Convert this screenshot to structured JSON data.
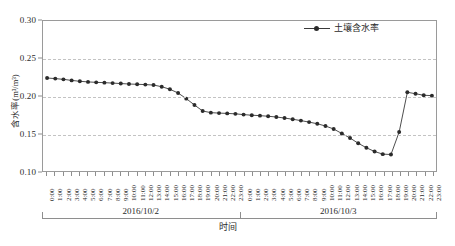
{
  "chart_data": {
    "type": "line",
    "title": "",
    "xlabel": "时间",
    "ylabel": "含水率(m³/m³)",
    "ylim": [
      0.1,
      0.3
    ],
    "y_ticks": [
      "0.30",
      "0.25",
      "0.20",
      "0.15",
      "0.10"
    ],
    "y_tick_values": [
      0.3,
      0.25,
      0.2,
      0.15,
      0.1
    ],
    "gridlines": [
      0.25,
      0.2,
      0.15
    ],
    "grid": true,
    "legend_position": "top-right",
    "marker": "circle",
    "line_color": "#3a3a3a",
    "marker_color": "#2b2b2b",
    "series": [
      {
        "name": "土壤含水率",
        "values": [
          0.224,
          0.2232,
          0.2222,
          0.2208,
          0.2196,
          0.2188,
          0.2182,
          0.2178,
          0.2172,
          0.2166,
          0.216,
          0.2156,
          0.2152,
          0.2146,
          0.2124,
          0.209,
          0.204,
          0.1965,
          0.188,
          0.18,
          0.1778,
          0.1772,
          0.1768,
          0.1762,
          0.1752,
          0.1744,
          0.1738,
          0.173,
          0.172,
          0.1706,
          0.169,
          0.1672,
          0.1652,
          0.163,
          0.16,
          0.156,
          0.15,
          0.144,
          0.137,
          0.131,
          0.126,
          0.1225,
          0.122,
          0.152,
          0.205,
          0.203,
          0.201,
          0.2005
        ]
      }
    ],
    "categories": [
      "0:00",
      "1:00",
      "2:00",
      "3:00",
      "4:00",
      "5:00",
      "6:00",
      "7:00",
      "8:00",
      "9:00",
      "10:00",
      "11:00",
      "12:00",
      "13:00",
      "14:00",
      "15:00",
      "16:00",
      "17:00",
      "18:00",
      "19:00",
      "20:00",
      "21:00",
      "22:00",
      "23:00",
      "0:00",
      "1:00",
      "2:00",
      "3:00",
      "4:00",
      "5:00",
      "6:00",
      "7:00",
      "8:00",
      "9:00",
      "10:00",
      "11:00",
      "12:00",
      "13:00",
      "14:00",
      "15:00",
      "16:00",
      "17:00",
      "18:00",
      "19:00",
      "20:00",
      "21:00",
      "22:00",
      "23:00"
    ],
    "x_groups": [
      {
        "label": "2016/10/2",
        "start_index": 0,
        "end_index": 23
      },
      {
        "label": "2016/10/3",
        "start_index": 24,
        "end_index": 47
      }
    ]
  },
  "legend": {
    "entries": [
      {
        "label": "土壤含水率"
      }
    ]
  }
}
